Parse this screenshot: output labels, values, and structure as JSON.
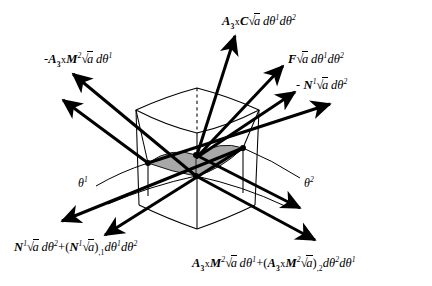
{
  "figure": {
    "type": "shell-differential-element-force-diagram",
    "background_color": "#ffffff",
    "line_color": "#000000",
    "midsurface_fill": "#a8a8a8"
  },
  "labels": {
    "top_center": {
      "id": "A3-cross-C-sqrt-a-dtheta1-dtheta2",
      "text": "A3xC√a dθ¹dθ²",
      "x": 222,
      "y": 16
    },
    "upper_left": {
      "id": "minus-A3-cross-M2-sqrt-a-dtheta1",
      "text": "-A3xM²√a dθ¹",
      "x": 44,
      "y": 54
    },
    "upper_right_1": {
      "id": "F-sqrt-a-dtheta1-dtheta2",
      "text": "F√a dθ¹dθ²",
      "x": 288,
      "y": 54
    },
    "upper_right_2": {
      "id": "minus-N1-sqrt-a-dtheta2",
      "text": "- N¹√a dθ²",
      "x": 296,
      "y": 80
    },
    "theta1": {
      "id": "theta-1",
      "text": "θ¹",
      "x": 78,
      "y": 178
    },
    "theta2": {
      "id": "theta-2",
      "text": "θ²",
      "x": 304,
      "y": 178
    },
    "bottom_left": {
      "id": "N1-sqrt-a-dtheta2-plus-N1-sqrt-a-comma-1-dtheta1-dtheta2",
      "text": "N¹√a dθ²+(N¹√a),₁dθ¹dθ²",
      "x": 14,
      "y": 242
    },
    "bottom_right": {
      "id": "A3-cross-M2-sqrt-a-dtheta1-plus-A3-cross-M2-sqrt-a-comma-2-dtheta2-dtheta1",
      "text": "A3xM²√a dθ¹+(A3xM²√a),₂dθ²dθ¹",
      "x": 192,
      "y": 258
    }
  },
  "nodes": {
    "left": {
      "x": 148,
      "y": 163
    },
    "top": {
      "x": 196,
      "y": 155
    },
    "right": {
      "x": 243,
      "y": 148
    },
    "bottom": {
      "x": 196,
      "y": 176
    }
  },
  "vector_groups": [
    {
      "name": "upper-left-pair",
      "count": 2,
      "direction": "up-left",
      "origin": "left-and-bottom-nodes"
    },
    {
      "name": "top-center-arrow",
      "count": 1,
      "direction": "up",
      "origin": "top-node"
    },
    {
      "name": "upper-right-triple",
      "count": 3,
      "direction": "up-right",
      "origin": "top-and-right-nodes"
    },
    {
      "name": "lower-left-pair",
      "count": 2,
      "direction": "down-left",
      "origin": "left-and-bottom-nodes"
    },
    {
      "name": "lower-right-pair",
      "count": 2,
      "direction": "down-right",
      "origin": "right-and-bottom-nodes"
    }
  ]
}
